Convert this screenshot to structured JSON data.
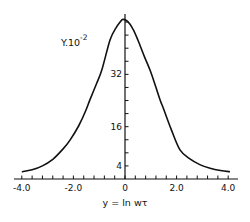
{
  "chart_data": {
    "type": "line",
    "title": "",
    "xlabel": "y = ln wτ",
    "ylabel": "Y.10",
    "ylabel_exponent": "-2",
    "xlim": [
      -4.0,
      4.0
    ],
    "ylim": [
      0,
      50
    ],
    "x_tick_labels": [
      "-4.0",
      "-2.0",
      "0",
      "2.0",
      "4.0"
    ],
    "x_tick_values": [
      -4.0,
      -2.0,
      0,
      2.0,
      4.0
    ],
    "x_minor_tick_step": 0.4,
    "y_tick_labels": [
      "4",
      "16",
      "32"
    ],
    "y_tick_values": [
      4,
      16,
      32
    ],
    "y_minor_tick_step": 4,
    "grid": false,
    "legend": null,
    "series": [
      {
        "name": "Y",
        "x": [
          -4.0,
          -3.6,
          -3.2,
          -2.8,
          -2.4,
          -2.13,
          -1.8,
          -1.51,
          -1.36,
          -1.1,
          -0.9,
          -0.58,
          -0.35,
          -0.19,
          -0.08,
          0.1,
          0.3,
          0.5,
          0.75,
          0.97,
          1.2,
          1.36,
          1.51,
          1.8,
          2.13,
          2.5,
          2.9,
          3.3,
          3.7,
          4.07
        ],
        "y": [
          2.2,
          2.8,
          4.0,
          6.0,
          9.2,
          11.9,
          16.2,
          21.1,
          24.2,
          29.2,
          33.3,
          42.5,
          46.2,
          48.0,
          48.8,
          48.2,
          46.0,
          42.5,
          37.5,
          33.3,
          28.0,
          24.2,
          21.1,
          15.0,
          8.9,
          6.2,
          4.4,
          3.3,
          2.6,
          2.2
        ]
      }
    ]
  },
  "labels": {
    "ylabel": "Y.10",
    "ylabel_exp": "-2",
    "xlabel": "y = ln wτ"
  }
}
